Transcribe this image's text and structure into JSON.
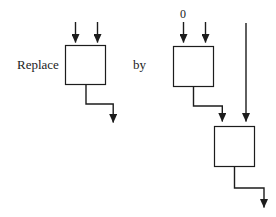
{
  "figure": {
    "labels": {
      "replace": "Replace",
      "by": "by",
      "zero": "0"
    },
    "colors": {
      "line": "#1c1c1c",
      "text": "#1c1c1c",
      "background": "#ffffff"
    },
    "structure": {
      "left_diagram": {
        "box_count": 1,
        "input_arrows": 2,
        "output_arrows": 1
      },
      "right_diagram": {
        "box_count": 2,
        "top_box_input_labels": [
          "0",
          ""
        ],
        "bottom_box_inputs": [
          "top-box-output",
          "pass-through-line"
        ],
        "output_arrows": 1
      }
    }
  }
}
